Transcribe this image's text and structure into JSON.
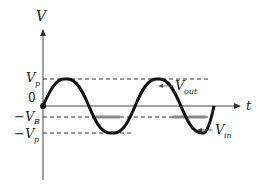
{
  "diagram": {
    "type": "waveform",
    "title": "",
    "axes": {
      "y_label": "V",
      "x_label": "t",
      "origin_label": "0"
    },
    "levels": [
      {
        "name": "Vp",
        "label_main": "V",
        "label_sub": "p",
        "prefix": ""
      },
      {
        "name": "-VB",
        "label_main": "V",
        "label_sub": "B",
        "prefix": "−"
      },
      {
        "name": "-Vp",
        "label_main": "V",
        "label_sub": "p",
        "prefix": "−"
      }
    ],
    "signals": [
      {
        "name": "Vout",
        "label_main": "V",
        "label_sub": "out",
        "color": "#888888"
      },
      {
        "name": "Vin",
        "label_main": "V",
        "label_sub": "in",
        "color": "#111111"
      }
    ],
    "colors": {
      "axis": "#444444",
      "dashed": "#333333",
      "vin": "#111111",
      "vout": "#8a8a8a"
    }
  }
}
